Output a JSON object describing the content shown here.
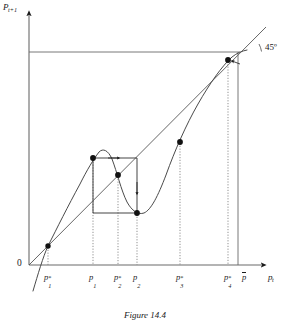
{
  "figure": {
    "caption": "Figure 14.4",
    "axes": {
      "y_label": "P",
      "y_label_sub": "t+1",
      "x_label": "p",
      "x_label_sub": "t",
      "origin_label": "0"
    },
    "annotations": {
      "angle_label": "45º"
    },
    "x_tick_labels": [
      {
        "name": "p-star-1",
        "base": "p",
        "sub": "1",
        "sup": "*",
        "x": 48
      },
      {
        "name": "p-1",
        "base": "p",
        "sub": "1",
        "sup": "",
        "x": 93
      },
      {
        "name": "p-star-2",
        "base": "p",
        "sub": "2",
        "sup": "*",
        "x": 118
      },
      {
        "name": "p-2",
        "base": "p",
        "sub": "2",
        "sup": "",
        "x": 137
      },
      {
        "name": "p-star-3",
        "base": "p",
        "sub": "3",
        "sup": "*",
        "x": 180
      },
      {
        "name": "p-star-4",
        "base": "p",
        "sub": "4",
        "sup": "*",
        "x": 228
      },
      {
        "name": "p-bar",
        "base": "p",
        "sub": "",
        "sup": "",
        "x": 246,
        "overbar": true
      }
    ]
  },
  "chart_data": {
    "type": "line",
    "title": "Figure 14.4",
    "xlabel": "p_t",
    "ylabel": "P_{t+1}",
    "xlim": [
      0,
      290
    ],
    "ylim": [
      0,
      325
    ],
    "grid": false,
    "legend": null,
    "series": [
      {
        "name": "45-degree-line",
        "style": "solid-thin",
        "points": [
          [
            29,
            265
          ],
          [
            266,
            27
          ]
        ]
      },
      {
        "name": "ceiling-line",
        "style": "solid-thin",
        "points": [
          [
            29,
            52
          ],
          [
            240,
            52
          ]
        ]
      },
      {
        "name": "p-bar-vertical",
        "style": "solid-thin",
        "points": [
          [
            238,
            52
          ],
          [
            238,
            265
          ]
        ]
      },
      {
        "name": "map-curve",
        "style": "solid",
        "points": [
          [
            33,
            290
          ],
          [
            38,
            272
          ],
          [
            43,
            256
          ],
          [
            48,
            246
          ],
          [
            55,
            233
          ],
          [
            63,
            218
          ],
          [
            72,
            200
          ],
          [
            81,
            181
          ],
          [
            88,
            167
          ],
          [
            93,
            158
          ],
          [
            98,
            152
          ],
          [
            103,
            150
          ],
          [
            108,
            152
          ],
          [
            113,
            160
          ],
          [
            118,
            175
          ],
          [
            124,
            192
          ],
          [
            130,
            205
          ],
          [
            136,
            212
          ],
          [
            141,
            214
          ],
          [
            146,
            212
          ],
          [
            152,
            205
          ],
          [
            159,
            190
          ],
          [
            167,
            170
          ],
          [
            176,
            148
          ],
          [
            186,
            127
          ],
          [
            196,
            108
          ],
          [
            206,
            90
          ],
          [
            216,
            74
          ],
          [
            226,
            62
          ],
          [
            234,
            55
          ],
          [
            240,
            52
          ],
          [
            246,
            51
          ]
        ]
      }
    ],
    "fixed_points": [
      {
        "name": "p-star-1",
        "x": 48,
        "y": 246
      },
      {
        "name": "p-star-2",
        "x": 118,
        "y": 175
      },
      {
        "name": "p-star-3",
        "x": 180,
        "y": 142
      },
      {
        "name": "p-star-4",
        "x": 228,
        "y": 60
      }
    ],
    "cobweb": {
      "corners": [
        {
          "name": "cobweb-top-left",
          "x": 93,
          "y": 158
        },
        {
          "name": "cobweb-bottom-right",
          "x": 137,
          "y": 213
        }
      ],
      "box": {
        "left": 93,
        "right": 137,
        "top": 158,
        "bottom": 213
      },
      "dotted_verticals": [
        {
          "x": 48,
          "y_top": 246,
          "y_bottom": 265
        },
        {
          "x": 93,
          "y_top": 158,
          "y_bottom": 265
        },
        {
          "x": 118,
          "y_top": 175,
          "y_bottom": 265
        },
        {
          "x": 137,
          "y_top": 213,
          "y_bottom": 265
        },
        {
          "x": 180,
          "y_top": 142,
          "y_bottom": 265
        },
        {
          "x": 228,
          "y_top": 60,
          "y_bottom": 265
        }
      ]
    },
    "colors": {
      "ink": "#1a1a1a",
      "line": "#555555",
      "dotted": "#777777",
      "point": "#111111"
    }
  }
}
